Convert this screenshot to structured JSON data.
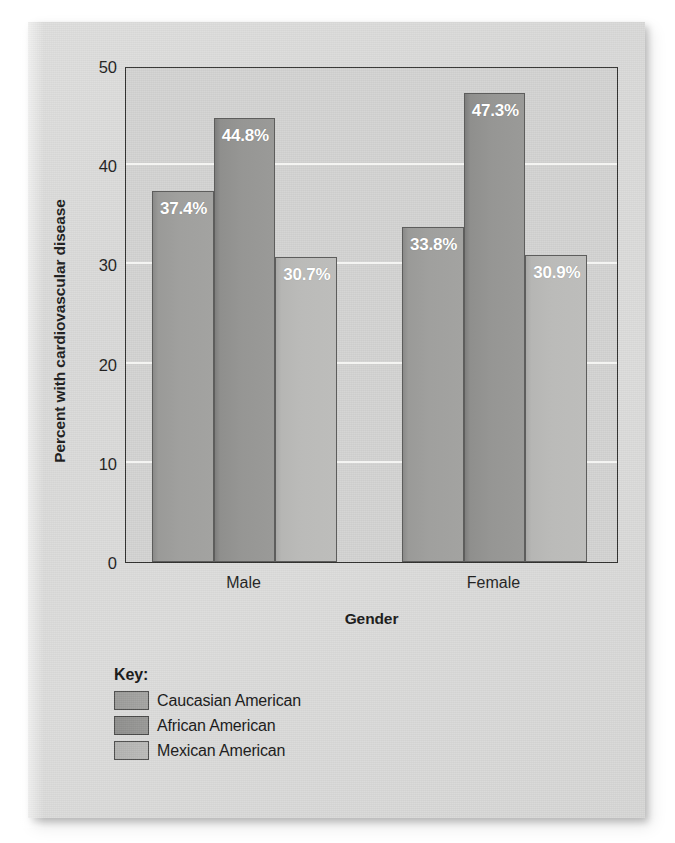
{
  "chart_data": {
    "type": "bar",
    "title": "",
    "subtitle": "",
    "xlabel": "Gender",
    "ylabel": "Percent with cardiovascular disease",
    "categories": [
      "Male",
      "Female"
    ],
    "series": [
      {
        "name": "Caucasian American",
        "values": [
          37.4,
          33.8
        ],
        "color": "#a0a09e"
      },
      {
        "name": "African American",
        "values": [
          44.8,
          47.3
        ],
        "color": "#96968f"
      },
      {
        "name": "Mexican American",
        "values": [
          30.7,
          30.9
        ],
        "color": "#bbbbb9"
      }
    ],
    "data_labels": [
      [
        "37.4%",
        "33.8%"
      ],
      [
        "44.8%",
        "47.3%"
      ],
      [
        "30.7%",
        "30.9%"
      ]
    ],
    "ylim": [
      0,
      50
    ],
    "yticks": [
      0,
      10,
      20,
      30,
      40,
      50
    ],
    "ytick_labels": [
      "0",
      "10",
      "20",
      "30",
      "40",
      "50"
    ],
    "grid": true,
    "grid_axis": "y",
    "legend_position": "below-plot-left",
    "plot_background": "#d3d3d2",
    "gridline_color": "#f4f4f2",
    "axis_color": "#31312f"
  },
  "legend": {
    "title": "Key:",
    "items": [
      {
        "label": "Caucasian American",
        "swatch": "c1"
      },
      {
        "label": "African American",
        "swatch": "c2"
      },
      {
        "label": "Mexican American",
        "swatch": "c3"
      }
    ]
  }
}
